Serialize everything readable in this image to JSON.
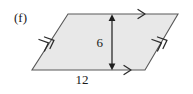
{
  "figure": {
    "part_label": "(f)",
    "shape_name": "parallelogram",
    "fill_color": "#e8e8e8",
    "stroke_color": "#585858",
    "text_color": "#1a1a1a",
    "background_color": "#ffffff",
    "vertices": [
      {
        "name": "top-left",
        "x": 68,
        "y": 14
      },
      {
        "name": "top-right",
        "x": 178,
        "y": 14
      },
      {
        "name": "bottom-right",
        "x": 145,
        "y": 70
      },
      {
        "name": "bottom-left",
        "x": 32,
        "y": 70
      }
    ],
    "tick_marks": [
      {
        "edge": "top",
        "chevrons": 1,
        "direction": "right"
      },
      {
        "edge": "bottom",
        "chevrons": 1,
        "direction": "right"
      },
      {
        "edge": "left",
        "chevrons": 2,
        "direction": "up-right"
      },
      {
        "edge": "right",
        "chevrons": 2,
        "direction": "up-right"
      }
    ],
    "dimensions": {
      "height": {
        "label": "6",
        "arrow": "double-headed-vertical",
        "x": 112,
        "y_top": 15,
        "y_bottom": 70,
        "label_x": 103,
        "label_y": 47
      },
      "base": {
        "label": "12",
        "label_x": 82,
        "label_y": 84
      }
    }
  }
}
